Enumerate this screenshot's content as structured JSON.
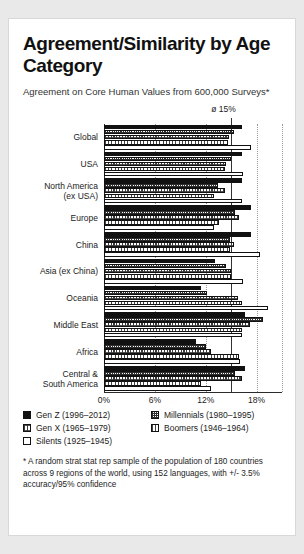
{
  "card": {
    "title": "Agreement/Similarity by Age Category",
    "subtitle": "Agreement on Core Human Values from 600,000 Surveys*",
    "footnote": "* A random strat stat rep sample of the population of 180 countries across 9 regions of the world, using 152 languages, with +/- 3.5% accuracy/95% confidence"
  },
  "legend": {
    "items": [
      {
        "key": "gen-z",
        "label": "Gen Z (1996–2012)",
        "swatch": "solid-black"
      },
      {
        "key": "millennials",
        "label": "Millennials (1980–1995)",
        "swatch": "dense-stipple"
      },
      {
        "key": "gen-x",
        "label": "Gen X (1965–1979)",
        "swatch": "medium-hatch"
      },
      {
        "key": "boomers",
        "label": "Boomers (1946–1964)",
        "swatch": "light-hatch"
      },
      {
        "key": "silents",
        "label": "Silents (1925–1945)",
        "swatch": "white-outline"
      }
    ]
  },
  "chart_data": {
    "type": "bar",
    "orientation": "horizontal",
    "title": "Agreement/Similarity by Age Category",
    "subtitle": "Agreement on Core Human Values from 600,000 Surveys*",
    "xlabel": "",
    "ylabel": "",
    "xlim": [
      0,
      21
    ],
    "xticks": [
      0,
      6,
      12,
      18
    ],
    "xticklabels": [
      "0%",
      "6%",
      "12%",
      "18%"
    ],
    "grid": "vertical-dotted",
    "legend_position": "below",
    "annotations": [
      {
        "name": "average-reference-line",
        "value": 15,
        "label": "ø 15%"
      }
    ],
    "categories": [
      "Global",
      "USA",
      "North America\n(ex USA)",
      "Europe",
      "China",
      "Asia (ex China)",
      "Oceania",
      "Middle East",
      "Africa",
      "Central &\nSouth America"
    ],
    "series": [
      {
        "name": "Gen Z (1996–2012)",
        "values": [
          16.3,
          16.3,
          16.3,
          17.4,
          17.4,
          13.1,
          11.4,
          16.6,
          10.8,
          16.6
        ]
      },
      {
        "name": "Millennials (1980–1995)",
        "values": [
          15.3,
          15.0,
          13.4,
          15.4,
          14.9,
          14.4,
          12.2,
          18.8,
          12.0,
          15.4
        ]
      },
      {
        "name": "Gen X (1965–1979)",
        "values": [
          14.7,
          14.4,
          14.3,
          15.9,
          15.3,
          15.0,
          15.8,
          17.2,
          12.6,
          16.3
        ]
      },
      {
        "name": "Boomers (1946–1964)",
        "values": [
          14.6,
          14.3,
          13.0,
          13.6,
          14.9,
          15.0,
          16.3,
          16.3,
          15.9,
          11.5
        ]
      },
      {
        "name": "Silents (1925–1945)",
        "values": [
          17.4,
          16.4,
          16.3,
          13.0,
          18.4,
          16.4,
          19.4,
          16.3,
          16.0,
          12.6
        ]
      }
    ]
  }
}
